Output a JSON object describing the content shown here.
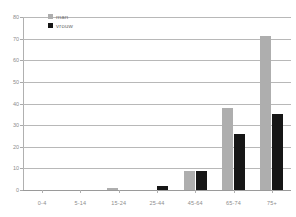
{
  "chart_data": {
    "type": "bar",
    "title": "",
    "xlabel": "",
    "ylabel": "",
    "categories": [
      "0-4",
      "5-14",
      "15-24",
      "25-44",
      "45-64",
      "65-74",
      "75+"
    ],
    "series": [
      {
        "name": "man",
        "color": "#aeaeae",
        "values": [
          0,
          0,
          1,
          0,
          9,
          38,
          71
        ]
      },
      {
        "name": "vrouw",
        "color": "#161616",
        "values": [
          0,
          0,
          0,
          2,
          9,
          26,
          35
        ]
      }
    ],
    "ylim": [
      0,
      80
    ],
    "yticks": [
      0,
      10,
      20,
      30,
      40,
      50,
      60,
      70,
      80
    ],
    "ytick_labels": [
      "0",
      "10",
      "20",
      "30",
      "40",
      "50",
      "60",
      "70",
      "80"
    ],
    "grid": true,
    "legend_position": "top-left"
  },
  "legend": {
    "items": [
      {
        "label": "man"
      },
      {
        "label": "vrouw"
      }
    ]
  }
}
